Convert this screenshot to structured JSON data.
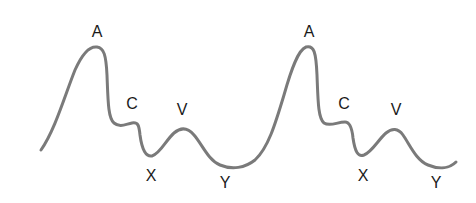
{
  "diagram": {
    "title": "",
    "wave_color": "#7a7a7a",
    "label_color": "#1a1a1a",
    "cycles": [
      {
        "labels": {
          "a": "A",
          "c": "C",
          "v": "V",
          "x": "X",
          "y": "Y"
        }
      },
      {
        "labels": {
          "a": "A",
          "c": "C",
          "v": "V",
          "x": "X",
          "y": "Y"
        }
      }
    ]
  }
}
